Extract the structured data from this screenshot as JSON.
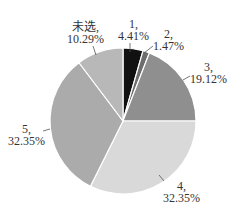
{
  "chart_data": {
    "type": "pie",
    "title": "",
    "categories": [
      "1",
      "2",
      "3",
      "4",
      "5",
      "未选"
    ],
    "values": [
      4.41,
      1.47,
      19.12,
      32.35,
      32.35,
      10.29
    ],
    "unit": "%",
    "labels": [
      {
        "name": "1,",
        "pct": "4.41%"
      },
      {
        "name": "2,",
        "pct": "1.47%"
      },
      {
        "name": "3,",
        "pct": "19.12%"
      },
      {
        "name": "4,",
        "pct": "32.35%"
      },
      {
        "name": "5,",
        "pct": "32.35%"
      },
      {
        "name": "未选,",
        "pct": "10.29%"
      }
    ],
    "colors": [
      "#111111",
      "#6e6e6e",
      "#8f8f8f",
      "#d9d9d9",
      "#ababab",
      "#b8b8b8"
    ],
    "start_angle_deg": 0,
    "direction": "clockwise",
    "legend": "none",
    "data_labels": "outside with leader lines"
  }
}
